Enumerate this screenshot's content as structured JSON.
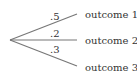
{
  "diagram": {
    "type": "probability-tree",
    "colors": {
      "branch": "#777777",
      "text": "#333333",
      "background": "#ffffff"
    },
    "root": {
      "x": 10,
      "y": 40
    },
    "branches": [
      {
        "probability": ".5",
        "outcome": "outcome 1",
        "end": {
          "x": 77,
          "y": 14
        }
      },
      {
        "probability": ".2",
        "outcome": "outcome 2",
        "end": {
          "x": 77,
          "y": 40
        }
      },
      {
        "probability": ".3",
        "outcome": "outcome 3",
        "end": {
          "x": 77,
          "y": 66
        }
      }
    ]
  }
}
